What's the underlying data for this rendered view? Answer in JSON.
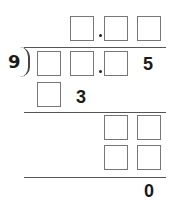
{
  "problem": {
    "type": "long-division",
    "divisor": "9",
    "quotient": {
      "boxes": 3,
      "decimal_after_box": 1
    },
    "dividend": {
      "boxes": 3,
      "decimal_after_box": 2,
      "trailing_digit": "5"
    },
    "steps": [
      {
        "row": 1,
        "boxes": 1,
        "digit": "3"
      },
      {
        "row": 2,
        "boxes": 2
      },
      {
        "row": 3,
        "boxes": 2
      }
    ],
    "remainder": "0"
  },
  "colors": {
    "box_border": "#777777",
    "text": "#1a1a1a",
    "line": "#555555"
  }
}
